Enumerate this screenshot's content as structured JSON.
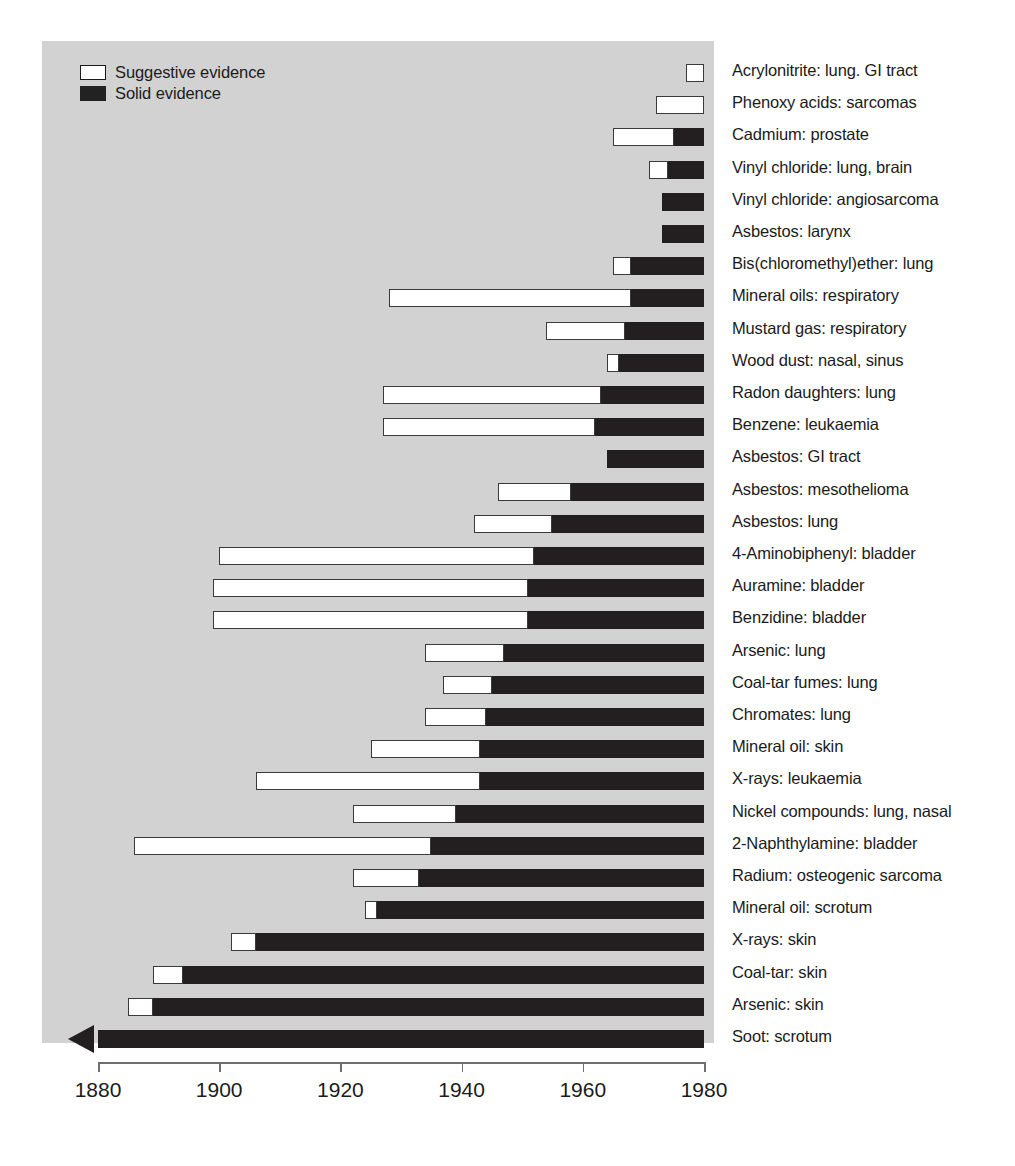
{
  "legend": {
    "items": [
      {
        "label": "Suggestive evidence",
        "swatch": "suggestive",
        "color": "#ffffff"
      },
      {
        "label": "Solid evidence",
        "swatch": "solid",
        "color": "#231f20"
      }
    ]
  },
  "axis": {
    "ticks": [
      1880,
      1900,
      1920,
      1940,
      1960,
      1980
    ],
    "tick_labels": [
      "1880",
      "1900",
      "1920",
      "1940",
      "1960",
      "1980"
    ],
    "min": 1880,
    "max": 1980
  },
  "colors": {
    "panel_background": "#d2d2d2",
    "suggestive": "#ffffff",
    "solid": "#231f20",
    "text": "#1b1b1b",
    "axis": "#6f6f6f"
  },
  "chart_data": {
    "type": "bar",
    "orientation": "horizontal",
    "subtype": "timeline-gantt",
    "title": "",
    "xlabel": "",
    "ylabel": "",
    "xlim": [
      1880,
      1980
    ],
    "grid": false,
    "legend_position": "top-left",
    "series": [
      {
        "name": "Suggestive evidence",
        "color": "#ffffff"
      },
      {
        "name": "Solid evidence",
        "color": "#231f20"
      }
    ],
    "note": "Each row spans from the first suggestive evidence year to 1980; the white portion is the suggestive-evidence period and the black portion is the solid-evidence period. 'Soot: scrotum' extends open-ended before 1880 (arrow).",
    "categories": [
      "Acrylonitrite: lung. GI tract",
      "Phenoxy acids: sarcomas",
      "Cadmium: prostate",
      "Vinyl chloride: lung, brain",
      "Vinyl chloride: angiosarcoma",
      "Asbestos: larynx",
      "Bis(chloromethyl)ether: lung",
      "Mineral oils: respiratory",
      "Mustard gas: respiratory",
      "Wood dust: nasal, sinus",
      "Radon daughters: lung",
      "Benzene: leukaemia",
      "Asbestos: GI tract",
      "Asbestos: mesothelioma",
      "Asbestos: lung",
      "4-Aminobiphenyl: bladder",
      "Auramine: bladder",
      "Benzidine: bladder",
      "Arsenic: lung",
      "Coal-tar fumes: lung",
      "Chromates: lung",
      "Mineral oil: skin",
      "X-rays: leukaemia",
      "Nickel compounds: lung, nasal",
      "2-Naphthylamine: bladder",
      "Radium: osteogenic sarcoma",
      "Mineral oil: scrotum",
      "X-rays: skin",
      "Coal-tar: skin",
      "Arsenic: skin",
      "Soot: scrotum"
    ],
    "rows": [
      {
        "label": "Acrylonitrite: lung. GI tract",
        "suggestive_start": 1977,
        "solid_start": null,
        "end": 1980,
        "open_ended": false
      },
      {
        "label": "Phenoxy acids: sarcomas",
        "suggestive_start": 1972,
        "solid_start": null,
        "end": 1980,
        "open_ended": false
      },
      {
        "label": "Cadmium: prostate",
        "suggestive_start": 1965,
        "solid_start": 1975,
        "end": 1980,
        "open_ended": false
      },
      {
        "label": "Vinyl chloride: lung, brain",
        "suggestive_start": 1971,
        "solid_start": 1974,
        "end": 1980,
        "open_ended": false
      },
      {
        "label": "Vinyl chloride: angiosarcoma",
        "suggestive_start": null,
        "solid_start": 1973,
        "end": 1980,
        "open_ended": false
      },
      {
        "label": "Asbestos: larynx",
        "suggestive_start": null,
        "solid_start": 1973,
        "end": 1980,
        "open_ended": false
      },
      {
        "label": "Bis(chloromethyl)ether: lung",
        "suggestive_start": 1965,
        "solid_start": 1968,
        "end": 1980,
        "open_ended": false
      },
      {
        "label": "Mineral oils: respiratory",
        "suggestive_start": 1928,
        "solid_start": 1968,
        "end": 1980,
        "open_ended": false
      },
      {
        "label": "Mustard gas: respiratory",
        "suggestive_start": 1954,
        "solid_start": 1967,
        "end": 1980,
        "open_ended": false
      },
      {
        "label": "Wood dust: nasal, sinus",
        "suggestive_start": 1964,
        "solid_start": 1966,
        "end": 1980,
        "open_ended": false
      },
      {
        "label": "Radon daughters: lung",
        "suggestive_start": 1927,
        "solid_start": 1963,
        "end": 1980,
        "open_ended": false
      },
      {
        "label": "Benzene: leukaemia",
        "suggestive_start": 1927,
        "solid_start": 1962,
        "end": 1980,
        "open_ended": false
      },
      {
        "label": "Asbestos: GI tract",
        "suggestive_start": null,
        "solid_start": 1964,
        "end": 1980,
        "open_ended": false
      },
      {
        "label": "Asbestos: mesothelioma",
        "suggestive_start": 1946,
        "solid_start": 1958,
        "end": 1980,
        "open_ended": false
      },
      {
        "label": "Asbestos: lung",
        "suggestive_start": 1942,
        "solid_start": 1955,
        "end": 1980,
        "open_ended": false
      },
      {
        "label": "4-Aminobiphenyl: bladder",
        "suggestive_start": 1900,
        "solid_start": 1952,
        "end": 1980,
        "open_ended": false
      },
      {
        "label": "Auramine: bladder",
        "suggestive_start": 1899,
        "solid_start": 1951,
        "end": 1980,
        "open_ended": false
      },
      {
        "label": "Benzidine: bladder",
        "suggestive_start": 1899,
        "solid_start": 1951,
        "end": 1980,
        "open_ended": false
      },
      {
        "label": "Arsenic: lung",
        "suggestive_start": 1934,
        "solid_start": 1947,
        "end": 1980,
        "open_ended": false
      },
      {
        "label": "Coal-tar fumes: lung",
        "suggestive_start": 1937,
        "solid_start": 1945,
        "end": 1980,
        "open_ended": false
      },
      {
        "label": "Chromates: lung",
        "suggestive_start": 1934,
        "solid_start": 1944,
        "end": 1980,
        "open_ended": false
      },
      {
        "label": "Mineral oil: skin",
        "suggestive_start": 1925,
        "solid_start": 1943,
        "end": 1980,
        "open_ended": false
      },
      {
        "label": "X-rays: leukaemia",
        "suggestive_start": 1906,
        "solid_start": 1943,
        "end": 1980,
        "open_ended": false
      },
      {
        "label": "Nickel compounds: lung, nasal",
        "suggestive_start": 1922,
        "solid_start": 1939,
        "end": 1980,
        "open_ended": false
      },
      {
        "label": "2-Naphthylamine: bladder",
        "suggestive_start": 1886,
        "solid_start": 1935,
        "end": 1980,
        "open_ended": false
      },
      {
        "label": "Radium: osteogenic sarcoma",
        "suggestive_start": 1922,
        "solid_start": 1933,
        "end": 1980,
        "open_ended": false
      },
      {
        "label": "Mineral oil: scrotum",
        "suggestive_start": 1924,
        "solid_start": 1926,
        "end": 1980,
        "open_ended": false
      },
      {
        "label": "X-rays: skin",
        "suggestive_start": 1902,
        "solid_start": 1906,
        "end": 1980,
        "open_ended": false
      },
      {
        "label": "Coal-tar: skin",
        "suggestive_start": 1889,
        "solid_start": 1894,
        "end": 1980,
        "open_ended": false
      },
      {
        "label": "Arsenic: skin",
        "suggestive_start": 1885,
        "solid_start": 1889,
        "end": 1980,
        "open_ended": false
      },
      {
        "label": "Soot: scrotum",
        "suggestive_start": null,
        "solid_start": 1880,
        "end": 1980,
        "open_ended": true
      }
    ]
  }
}
